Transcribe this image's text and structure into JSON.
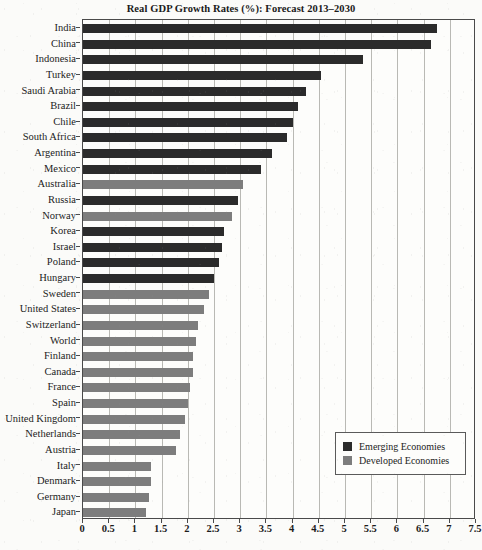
{
  "chart_data": {
    "type": "bar",
    "orientation": "horizontal",
    "title": "Real GDP Growth Rates (%): Forecast 2013–2030",
    "xlabel": "",
    "ylabel": "",
    "xlim": [
      0,
      7.5
    ],
    "xticks": [
      "0",
      "0.5",
      "1",
      "1.5",
      "2",
      "2.5",
      "3",
      "3.5",
      "4",
      "4.5",
      "5",
      "5.5",
      "6",
      "6.5",
      "7",
      "7.5"
    ],
    "xtick_values": [
      0,
      0.5,
      1,
      1.5,
      2,
      2.5,
      3,
      3.5,
      4,
      4.5,
      5,
      5.5,
      6,
      6.5,
      7,
      7.5
    ],
    "grid": "vertical",
    "legend_position": "bottom-right",
    "legend": [
      {
        "label": "Emerging Economies",
        "group": "emerging",
        "color": "#2b2b2b"
      },
      {
        "label": "Developed Economies",
        "group": "developed",
        "color": "#7d7d7d"
      }
    ],
    "categories": [
      "India",
      "China",
      "Indonesia",
      "Turkey",
      "Saudi Arabia",
      "Brazil",
      "Chile",
      "South Africa",
      "Argentina",
      "Mexico",
      "Australia",
      "Russia",
      "Norway",
      "Korea",
      "Israel",
      "Poland",
      "Hungary",
      "Sweden",
      "United States",
      "Switzerland",
      "World",
      "Finland",
      "Canada",
      "France",
      "Spain",
      "United Kingdom",
      "Netherlands",
      "Austria",
      "Italy",
      "Denmark",
      "Germany",
      "Japan"
    ],
    "bars": [
      {
        "label": "India",
        "value": 6.75,
        "group": "emerging"
      },
      {
        "label": "China",
        "value": 6.65,
        "group": "emerging"
      },
      {
        "label": "Indonesia",
        "value": 5.35,
        "group": "emerging"
      },
      {
        "label": "Turkey",
        "value": 4.55,
        "group": "emerging"
      },
      {
        "label": "Saudi Arabia",
        "value": 4.25,
        "group": "emerging"
      },
      {
        "label": "Brazil",
        "value": 4.1,
        "group": "emerging"
      },
      {
        "label": "Chile",
        "value": 4.0,
        "group": "emerging"
      },
      {
        "label": "South Africa",
        "value": 3.9,
        "group": "emerging"
      },
      {
        "label": "Argentina",
        "value": 3.6,
        "group": "emerging"
      },
      {
        "label": "Mexico",
        "value": 3.4,
        "group": "emerging"
      },
      {
        "label": "Australia",
        "value": 3.05,
        "group": "developed"
      },
      {
        "label": "Russia",
        "value": 2.95,
        "group": "emerging"
      },
      {
        "label": "Norway",
        "value": 2.85,
        "group": "developed"
      },
      {
        "label": "Korea",
        "value": 2.7,
        "group": "emerging"
      },
      {
        "label": "Israel",
        "value": 2.65,
        "group": "emerging"
      },
      {
        "label": "Poland",
        "value": 2.6,
        "group": "emerging"
      },
      {
        "label": "Hungary",
        "value": 2.5,
        "group": "emerging"
      },
      {
        "label": "Sweden",
        "value": 2.4,
        "group": "developed"
      },
      {
        "label": "United States",
        "value": 2.3,
        "group": "developed"
      },
      {
        "label": "Switzerland",
        "value": 2.2,
        "group": "developed"
      },
      {
        "label": "World",
        "value": 2.15,
        "group": "developed"
      },
      {
        "label": "Finland",
        "value": 2.1,
        "group": "developed"
      },
      {
        "label": "Canada",
        "value": 2.1,
        "group": "developed"
      },
      {
        "label": "France",
        "value": 2.05,
        "group": "developed"
      },
      {
        "label": "Spain",
        "value": 2.0,
        "group": "developed"
      },
      {
        "label": "United Kingdom",
        "value": 1.95,
        "group": "developed"
      },
      {
        "label": "Netherlands",
        "value": 1.85,
        "group": "developed"
      },
      {
        "label": "Austria",
        "value": 1.78,
        "group": "developed"
      },
      {
        "label": "Italy",
        "value": 1.3,
        "group": "developed"
      },
      {
        "label": "Denmark",
        "value": 1.3,
        "group": "developed"
      },
      {
        "label": "Germany",
        "value": 1.25,
        "group": "developed"
      },
      {
        "label": "Japan",
        "value": 1.2,
        "group": "developed"
      }
    ]
  }
}
